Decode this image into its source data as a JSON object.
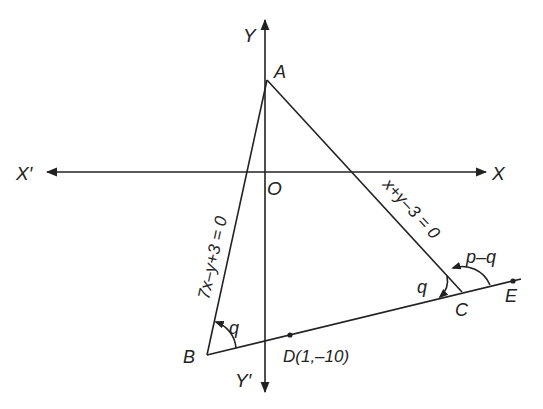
{
  "diagram": {
    "type": "coordinate-geometry-triangle",
    "axes": {
      "x_positive_label": "X",
      "x_negative_label": "X′",
      "y_positive_label": "Y",
      "y_negative_label": "Y′",
      "origin_label": "O"
    },
    "points": {
      "A": {
        "label": "A"
      },
      "B": {
        "label": "B"
      },
      "C": {
        "label": "C"
      },
      "D": {
        "label": "D(1,–10)"
      },
      "E": {
        "label": "E"
      }
    },
    "lines": {
      "AB": {
        "equation": "7x–y+3 = 0"
      },
      "AC": {
        "equation": "x+y–3 = 0"
      }
    },
    "angles": {
      "at_B": "q",
      "at_C_inner": "q",
      "at_C_outer": "p–q"
    },
    "colors": {
      "stroke": "#222222",
      "background": "#ffffff"
    }
  }
}
